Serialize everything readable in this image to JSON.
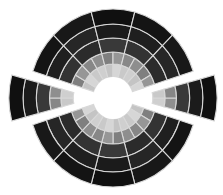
{
  "figure": {
    "width": 223,
    "height": 195,
    "center": [
      113,
      98
    ],
    "x_scale": 0.945,
    "background": "#ffffff",
    "divider_color": "#d8d8d8",
    "divider_width": 1.1,
    "hole_radius": 21,
    "hole_color": "#ffffff",
    "rings": [
      {
        "r_inner": 21,
        "r_outer": 34,
        "sector_deg": 15,
        "offset_deg": 0,
        "colors": [
          "#cfcfcf",
          "#c4c4c4",
          "#d6d6d6",
          "#c9c9c9"
        ]
      },
      {
        "r_inner": 34,
        "r_outer": 46,
        "sector_deg": 15,
        "offset_deg": 0,
        "colors": [
          "#8e8e8e",
          "#7f7f7f",
          "#969696",
          "#878787"
        ]
      },
      {
        "r_inner": 46,
        "r_outer": 60,
        "sector_deg": 30,
        "offset_deg": 15,
        "colors": [
          "#333333",
          "#2b2b2b",
          "#393939"
        ]
      },
      {
        "r_inner": 60,
        "r_outer": 74,
        "sector_deg": 30,
        "offset_deg": 15,
        "colors": [
          "#1f1f1f",
          "#262626",
          "#1b1b1b"
        ]
      },
      {
        "r_inner": 74,
        "r_outer": 89,
        "sector_deg": 30,
        "offset_deg": 15,
        "colors": [
          "#141414",
          "#181818",
          "#101010"
        ]
      }
    ],
    "wedges": [
      {
        "name": "left-wedge",
        "start_deg": 165,
        "end_deg": 195,
        "shift": 20
      },
      {
        "name": "right-wedge",
        "start_deg": -15,
        "end_deg": 15,
        "shift": 20
      }
    ],
    "gap_half_width_deg": 2.5
  }
}
